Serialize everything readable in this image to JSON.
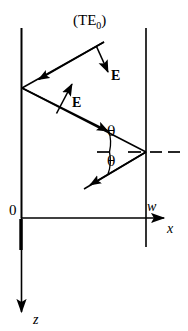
{
  "figure": {
    "title": "(TE0)",
    "background_color": "#ffffff",
    "stroke_color": "#000000",
    "labels": {
      "mode_prefix": "(TE",
      "mode_subscript": "0",
      "mode_suffix": ")",
      "e_field_upper": "E",
      "e_field_lower": "E",
      "theta_upper": "θ",
      "theta_lower": "θ",
      "origin": "0",
      "guide_width": "w",
      "axis_x": "x",
      "axis_z": "z"
    },
    "geometry": {
      "left_wall_x": 21,
      "right_wall_x": 146,
      "wall_top_y": 28,
      "wall_bottom_y": 247,
      "x_axis_y": 218,
      "x_axis_end_x": 170,
      "z_axis_end_y": 318,
      "left_vertex": [
        22,
        88
      ],
      "right_vertex": [
        146,
        152
      ],
      "ray_start": [
        104,
        42
      ],
      "ray_end": [
        84,
        189
      ],
      "normal_dash_left": 97,
      "normal_dash_right": 180
    }
  }
}
